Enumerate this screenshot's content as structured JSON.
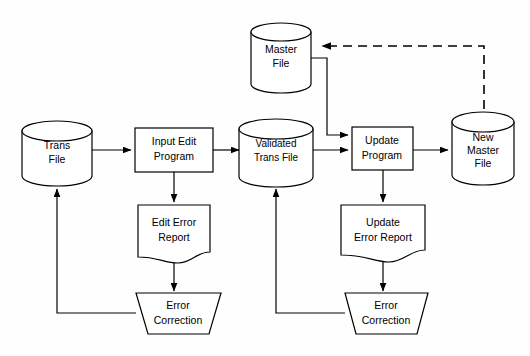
{
  "diagram": {
    "background_color": "#fefefe",
    "line_color": "#000000",
    "nodes": {
      "trans_file": {
        "label_line1": "Trans",
        "label_line2": "File",
        "shape": "cylinder-database"
      },
      "master_file": {
        "label_line1": "Master",
        "label_line2": "File",
        "shape": "cylinder-database"
      },
      "validated_trans_file": {
        "label_line1": "Validated",
        "label_line2": "Trans File",
        "shape": "cylinder-database"
      },
      "new_master_file": {
        "label_line1": "New",
        "label_line2": "Master",
        "label_line3": "File",
        "shape": "cylinder-database"
      },
      "input_edit_program": {
        "label_line1": "Input Edit",
        "label_line2": "Program",
        "shape": "process-rectangle"
      },
      "update_program": {
        "label_line1": "Update",
        "label_line2": "Program",
        "shape": "process-rectangle"
      },
      "edit_error_report": {
        "label_line1": "Edit Error",
        "label_line2": "Report",
        "shape": "document"
      },
      "update_error_report": {
        "label_line1": "Update",
        "label_line2": "Error Report",
        "shape": "document"
      },
      "error_correction_left": {
        "label_line1": "Error",
        "label_line2": "Correction",
        "shape": "manual-operation-trapezoid"
      },
      "error_correction_right": {
        "label_line1": "Error",
        "label_line2": "Correction",
        "shape": "manual-operation-trapezoid"
      }
    },
    "connectors": [
      {
        "name": "trans-file-to-input-edit",
        "style": "solid",
        "arrow": true
      },
      {
        "name": "input-edit-to-validated-trans",
        "style": "solid",
        "arrow": true
      },
      {
        "name": "input-edit-to-edit-error-report",
        "style": "solid",
        "arrow": true
      },
      {
        "name": "edit-error-report-to-error-correction-left",
        "style": "solid",
        "arrow": true
      },
      {
        "name": "error-correction-left-to-trans-file",
        "style": "solid",
        "arrow": true
      },
      {
        "name": "validated-trans-to-update-program",
        "style": "solid",
        "arrow": true
      },
      {
        "name": "master-file-to-update-program",
        "style": "solid",
        "arrow": true
      },
      {
        "name": "update-program-to-new-master-file",
        "style": "solid",
        "arrow": true
      },
      {
        "name": "update-program-to-update-error-report",
        "style": "solid",
        "arrow": true
      },
      {
        "name": "update-error-report-to-error-correction-right",
        "style": "solid",
        "arrow": true
      },
      {
        "name": "error-correction-right-to-validated-trans",
        "style": "solid",
        "arrow": true
      },
      {
        "name": "new-master-file-to-master-file",
        "style": "dashed",
        "arrow": true
      }
    ]
  }
}
